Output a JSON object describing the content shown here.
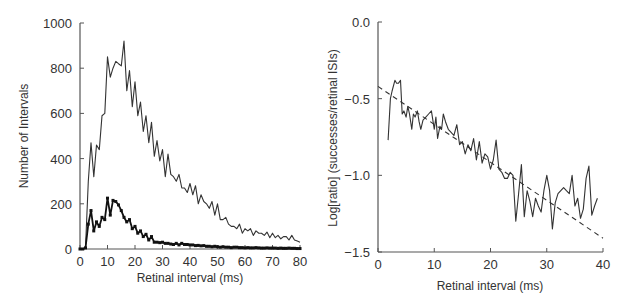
{
  "chart_data": [
    {
      "type": "line",
      "title": "",
      "xlabel": "Retinal interval   (ms)",
      "ylabel": "Number of Intervals",
      "xlim": [
        0,
        80
      ],
      "ylim": [
        0,
        1000
      ],
      "xticks": [
        0,
        10,
        20,
        30,
        40,
        50,
        60,
        70,
        80
      ],
      "yticks": [
        0,
        200,
        400,
        600,
        800,
        1000
      ],
      "grid": false,
      "legend": null,
      "series": [
        {
          "name": "all retinal intervals",
          "style": "thin solid line",
          "x": [
            0,
            1,
            2,
            3,
            4,
            5,
            6,
            7,
            8,
            9,
            10,
            11,
            12,
            13,
            14,
            15,
            16,
            17,
            18,
            19,
            20,
            21,
            22,
            23,
            24,
            25,
            26,
            27,
            28,
            29,
            30,
            31,
            32,
            33,
            34,
            35,
            36,
            37,
            38,
            39,
            40,
            41,
            42,
            43,
            44,
            45,
            46,
            47,
            48,
            49,
            50,
            51,
            52,
            53,
            54,
            55,
            56,
            57,
            58,
            59,
            60,
            61,
            62,
            63,
            64,
            65,
            66,
            67,
            68,
            69,
            70,
            71,
            72,
            73,
            74,
            75,
            76,
            77,
            78,
            79,
            80
          ],
          "values": [
            0,
            0,
            5,
            300,
            470,
            320,
            460,
            440,
            590,
            600,
            850,
            760,
            800,
            830,
            820,
            810,
            920,
            700,
            790,
            630,
            740,
            590,
            650,
            520,
            590,
            470,
            560,
            410,
            480,
            390,
            440,
            320,
            420,
            330,
            320,
            300,
            330,
            270,
            270,
            250,
            290,
            240,
            280,
            200,
            240,
            210,
            200,
            180,
            210,
            150,
            200,
            130,
            130,
            140,
            110,
            100,
            100,
            90,
            110,
            70,
            90,
            80,
            90,
            60,
            80,
            70,
            70,
            60,
            75,
            50,
            70,
            50,
            60,
            45,
            55,
            55,
            40,
            60,
            40,
            35,
            30
          ]
        },
        {
          "name": "successful intervals",
          "style": "thick line with square markers",
          "x": [
            0,
            1,
            2,
            3,
            4,
            5,
            6,
            7,
            8,
            9,
            10,
            11,
            12,
            13,
            14,
            15,
            16,
            17,
            18,
            19,
            20,
            21,
            22,
            23,
            24,
            25,
            26,
            27,
            28,
            29,
            30,
            31,
            32,
            33,
            34,
            35,
            36,
            37,
            38,
            39,
            40,
            41,
            42,
            43,
            44,
            45,
            46,
            47,
            48,
            49,
            50,
            51,
            52,
            53,
            54,
            55,
            56,
            57,
            58,
            59,
            60,
            61,
            62,
            63,
            64,
            65,
            66,
            67,
            68,
            69,
            70,
            71,
            72,
            73,
            74,
            75,
            76,
            77,
            78,
            79,
            80
          ],
          "values": [
            0,
            0,
            5,
            110,
            170,
            80,
            120,
            100,
            140,
            130,
            225,
            150,
            215,
            210,
            195,
            170,
            140,
            120,
            130,
            90,
            100,
            70,
            80,
            55,
            65,
            40,
            55,
            30,
            30,
            28,
            30,
            25,
            25,
            22,
            20,
            25,
            18,
            25,
            20,
            20,
            18,
            18,
            15,
            16,
            14,
            15,
            12,
            12,
            10,
            12,
            10,
            8,
            10,
            8,
            8,
            6,
            8,
            8,
            6,
            6,
            5,
            6,
            5,
            5,
            6,
            5,
            4,
            4,
            5,
            4,
            4,
            4,
            3,
            4,
            3,
            3,
            4,
            3,
            3,
            2,
            2
          ]
        }
      ]
    },
    {
      "type": "line",
      "title": "",
      "xlabel": "Retinal interval   (ms)",
      "ylabel": "Log[ratio] (successes/retinal ISIs)",
      "xlim": [
        0,
        40
      ],
      "ylim": [
        -1.5,
        0.0
      ],
      "xticks": [
        0,
        10,
        20,
        30,
        40
      ],
      "yticks": [
        0.0,
        -0.5,
        -1.0,
        -1.5
      ],
      "ytick_labels": [
        "0.0",
        "-0.5",
        "-1.0",
        "-1.5"
      ],
      "grid": false,
      "legend": null,
      "series": [
        {
          "name": "log ratio",
          "style": "solid line",
          "x": [
            1.8,
            2.2,
            2.5,
            3.0,
            3.3,
            3.6,
            4.0,
            4.3,
            4.6,
            5.0,
            5.3,
            5.6,
            6.0,
            6.3,
            6.6,
            7.0,
            7.3,
            7.6,
            8.0,
            8.5,
            9.0,
            9.5,
            10.0,
            10.3,
            10.6,
            11.0,
            11.3,
            11.6,
            12.0,
            12.5,
            13.0,
            13.5,
            14.0,
            14.5,
            15.0,
            15.5,
            16.0,
            16.5,
            17.0,
            17.5,
            18.0,
            18.5,
            19.0,
            19.5,
            20.0,
            20.5,
            21.0,
            21.5,
            22.0,
            22.5,
            23.0,
            23.5,
            24.0,
            24.5,
            25.0,
            25.5,
            26.0,
            26.5,
            27.0,
            27.5,
            28.0,
            28.5,
            29.0,
            29.5,
            30.0,
            30.5,
            31.0,
            31.5,
            32.0,
            32.5,
            33.0,
            33.5,
            34.0,
            34.5,
            35.0,
            35.5,
            36.0,
            36.5,
            37.0,
            37.5,
            38.0,
            38.5,
            39.0,
            39.5,
            40.0
          ],
          "values": [
            -0.77,
            -0.5,
            -0.45,
            -0.38,
            -0.4,
            -0.4,
            -0.38,
            -0.6,
            -0.58,
            -0.62,
            -0.55,
            -0.6,
            -0.7,
            -0.6,
            -0.62,
            -0.58,
            -0.65,
            -0.7,
            -0.64,
            -0.62,
            -0.6,
            -0.58,
            -0.7,
            -0.62,
            -0.76,
            -0.68,
            -0.7,
            -0.6,
            -0.65,
            -0.7,
            -0.72,
            -0.74,
            -0.67,
            -0.8,
            -0.78,
            -0.86,
            -0.8,
            -0.84,
            -0.76,
            -0.9,
            -0.78,
            -0.92,
            -0.86,
            -0.88,
            -0.96,
            -0.9,
            -0.77,
            -0.96,
            -0.98,
            -1.02,
            -1.02,
            -0.98,
            -1.0,
            -1.3,
            -1.12,
            -0.93,
            -1.27,
            -1.1,
            -1.17,
            -1.27,
            -1.15,
            -1.2,
            -1.24,
            -1.1,
            -1.0,
            -1.1,
            -1.35,
            -1.18,
            -1.12,
            -1.1,
            -1.08,
            -1.1,
            -1.12,
            -1.0,
            -1.2,
            -1.15,
            -1.28,
            -1.22,
            -1.02,
            -0.94,
            -1.26,
            -1.2,
            -1.15
          ]
        },
        {
          "name": "linear fit",
          "style": "dashed line",
          "x": [
            0,
            40
          ],
          "values": [
            -0.42,
            -1.41
          ]
        }
      ]
    }
  ]
}
